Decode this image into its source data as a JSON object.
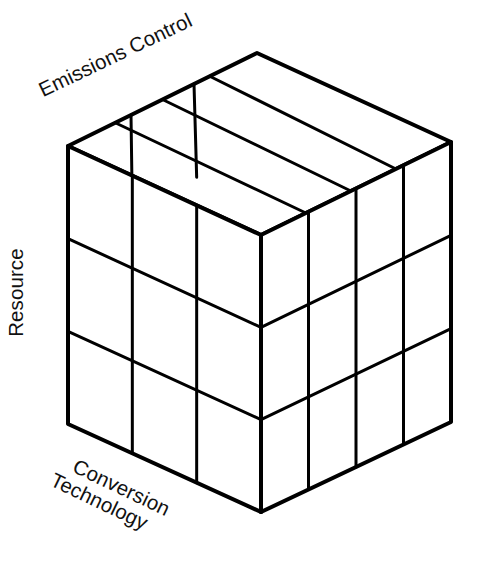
{
  "diagram": {
    "type": "isometric-cube-matrix",
    "title_visible": false,
    "background_color": "#ffffff",
    "stroke_color": "#000000",
    "face_fill_color": "#ffffff",
    "outer_stroke_width": 4,
    "inner_stroke_width": 3,
    "axes": [
      {
        "id": "emissions-control",
        "label": "Emissions Control",
        "divisions": 3,
        "rotation_deg": -25.6,
        "position": "top-left-edge"
      },
      {
        "id": "resource",
        "label": "Resource",
        "divisions": 3,
        "rotation_deg": -90,
        "position": "left-vertical-edge"
      },
      {
        "id": "conversion-technology",
        "label_lines": [
          "Conversion",
          "Technology"
        ],
        "label": "Conversion Technology",
        "divisions": 4,
        "rotation_deg": 25.6,
        "position": "bottom-left-edge"
      }
    ],
    "geometry": {
      "top_left": [
        68,
        146
      ],
      "top_apex": [
        257,
        53
      ],
      "top_right": [
        451,
        142
      ],
      "front_top": [
        261,
        235
      ],
      "bottom_left": [
        68,
        424
      ],
      "bottom_front": [
        261,
        512
      ],
      "bottom_right": [
        451,
        422
      ]
    },
    "faces": {
      "top": {
        "rows": 3,
        "cols": 4
      },
      "left": {
        "rows": 3,
        "cols": 3
      },
      "right": {
        "rows": 3,
        "cols": 4
      }
    }
  }
}
